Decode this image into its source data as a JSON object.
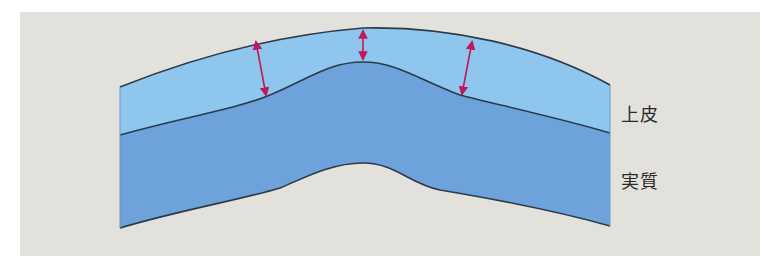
{
  "diagram": {
    "title": "",
    "colors": {
      "background": "#e3e1dc",
      "epithelium": "#8ec6ee",
      "stroma": "#6da3da",
      "outline": "#2b3a4a",
      "arrow": "#c0185a"
    },
    "layers": [
      {
        "id": "epithelium",
        "label": "上皮"
      },
      {
        "id": "stroma",
        "label": "実質"
      }
    ],
    "arrows": [
      {
        "id": "thickness-left",
        "from": [
          256,
          40
        ],
        "to": [
          267,
          97
        ]
      },
      {
        "id": "thickness-center",
        "from": [
          363,
          30
        ],
        "to": [
          363,
          60
        ]
      },
      {
        "id": "thickness-right",
        "from": [
          473,
          40
        ],
        "to": [
          461,
          96
        ]
      }
    ]
  }
}
